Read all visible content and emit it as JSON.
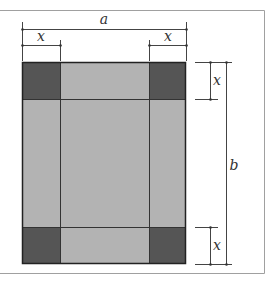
{
  "diagram": {
    "type": "dimensioned-rectangle",
    "labels": {
      "width": "a",
      "height": "b",
      "corner_top_left": "x",
      "corner_top_right": "x",
      "corner_right_top": "x",
      "corner_right_bottom": "x"
    },
    "colors": {
      "light_fill": "#b3b3b3",
      "dark_fill": "#555555",
      "outline": "#222222",
      "frame": "#999999",
      "dimension_line": "#444444"
    }
  }
}
